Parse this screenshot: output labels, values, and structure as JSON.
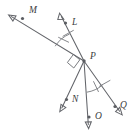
{
  "figure": {
    "background_color": "#ffffff",
    "stroke_color": "#63656a",
    "label_color": "#3a3c40",
    "width": 135,
    "height": 132
  },
  "vertex": {
    "name": "P",
    "label": "P",
    "x": 84,
    "y": 61
  },
  "points": [
    {
      "id": "M",
      "label": "M",
      "label_x": 29,
      "label_y": 13,
      "dot_x": 22.5,
      "dot_y": 18.5
    },
    {
      "id": "L",
      "label": "L",
      "label_x": 72,
      "label_y": 25,
      "dot_x": 65.5,
      "dot_y": 23.0
    },
    {
      "id": "P",
      "label": "P",
      "label_x": 92,
      "label_y": 60,
      "dot_x": 84.0,
      "dot_y": 61.0
    },
    {
      "id": "N",
      "label": "N",
      "label_x": 73,
      "label_y": 101,
      "dot_x": 66.5,
      "dot_y": 99.5
    },
    {
      "id": "O",
      "label": "O",
      "label_x": 96,
      "label_y": 119,
      "dot_x": 89.0,
      "dot_y": 117.0
    },
    {
      "id": "Q",
      "label": "Q",
      "label_x": 121,
      "label_y": 108,
      "dot_x": 115.0,
      "dot_y": 106.5
    }
  ],
  "rays": [
    {
      "id": "ray-PM",
      "from": "P",
      "through": "M",
      "arrow_x": 9.0,
      "arrow_y": 15.5,
      "arrowhead": true
    },
    {
      "id": "ray-PL",
      "from": "P",
      "through": "L",
      "arrow_x": 59.5,
      "arrow_y": 14.0,
      "arrowhead": true
    },
    {
      "id": "ray-PN",
      "from": "P",
      "through": "N",
      "arrow_x": 60.0,
      "arrow_y": 110.0,
      "arrowhead": true
    },
    {
      "id": "ray-PO",
      "from": "P",
      "through": "O",
      "arrow_x": 88.0,
      "arrow_y": 127.5,
      "arrowhead": true
    },
    {
      "id": "ray-PQ",
      "from": "P",
      "through": "Q",
      "arrow_x": 122.0,
      "arrow_y": 114.0,
      "arrowhead": true
    }
  ],
  "marks": {
    "right_angle": {
      "at": "P",
      "between": [
        "ray-PM",
        "ray-PN"
      ],
      "symbol": "square"
    },
    "congruent_angles": [
      {
        "id": "angle-MPL",
        "between": [
          "ray-PM",
          "ray-PL"
        ],
        "ticks": 1
      },
      {
        "id": "angle-OPQ",
        "between": [
          "ray-PO",
          "ray-PQ"
        ],
        "ticks": 1
      }
    ]
  },
  "labels": {
    "M": "M",
    "L": "L",
    "P": "P",
    "N": "N",
    "O": "O",
    "Q": "Q"
  }
}
